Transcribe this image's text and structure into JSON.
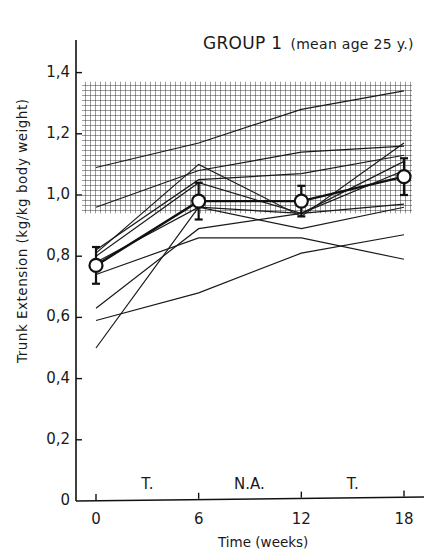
{
  "chart_data": {
    "type": "line",
    "title": "GROUP 1",
    "subtitle": "(mean age 25 y.)",
    "xlabel": "Time  (weeks)",
    "ylabel": "Trunk  Extension  (kg/kg  body  weight)",
    "x": [
      0,
      6,
      12,
      18
    ],
    "x_tick_labels": [
      "0",
      "6",
      "12",
      "18"
    ],
    "y_tick_labels": [
      "0",
      "0,2",
      "0,4",
      "0,6",
      "0,8",
      "1,0",
      "1,2",
      "1,4"
    ],
    "y_ticks": [
      0,
      0.2,
      0.4,
      0.6,
      0.8,
      1.0,
      1.2,
      1.4
    ],
    "ylim": [
      0,
      1.55
    ],
    "xlim": [
      -1,
      19
    ],
    "grid": false,
    "shaded_band": {
      "y_from": 0.94,
      "y_to": 1.37,
      "pattern": "crosshatch",
      "label": "normal range"
    },
    "phase_annotations": [
      {
        "label": "T.",
        "x": 3
      },
      {
        "label": "N.A.",
        "x": 9
      },
      {
        "label": "T.",
        "x": 15
      }
    ],
    "series": [
      {
        "name": "subject 1",
        "values": [
          1.09,
          1.17,
          1.28,
          1.34
        ]
      },
      {
        "name": "subject 2",
        "values": [
          0.96,
          1.08,
          1.14,
          1.16
        ]
      },
      {
        "name": "subject 3",
        "values": [
          0.82,
          1.05,
          1.07,
          1.13
        ]
      },
      {
        "name": "subject 4",
        "values": [
          0.81,
          1.1,
          0.93,
          1.17
        ]
      },
      {
        "name": "subject 5",
        "values": [
          0.8,
          1.04,
          0.94,
          1.11
        ]
      },
      {
        "name": "subject 6",
        "values": [
          0.5,
          0.96,
          0.94,
          0.97
        ]
      },
      {
        "name": "subject 7",
        "values": [
          0.63,
          0.89,
          0.94,
          1.08
        ]
      },
      {
        "name": "subject 8",
        "values": [
          0.74,
          0.86,
          0.86,
          0.79
        ]
      },
      {
        "name": "subject 9",
        "values": [
          0.59,
          0.68,
          0.81,
          0.87
        ]
      },
      {
        "name": "subject 10",
        "values": [
          0.78,
          0.96,
          0.89,
          0.96
        ]
      }
    ],
    "mean": {
      "name": "mean",
      "values": [
        0.77,
        0.98,
        0.98,
        1.06
      ],
      "error": [
        0.06,
        0.06,
        0.05,
        0.06
      ],
      "marker": "open-circle"
    }
  }
}
